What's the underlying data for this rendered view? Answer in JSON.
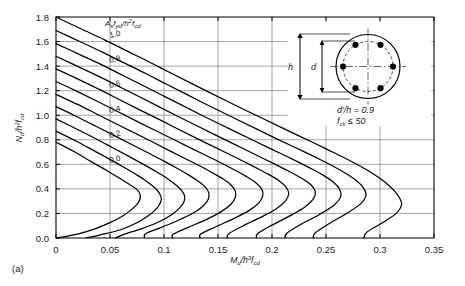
{
  "figure": {
    "panel_label": "(a)",
    "background": "#ffffff",
    "curve_color": "#000000",
    "grid_color": "#808080",
    "axis_color": "#000000"
  },
  "axes": {
    "x": {
      "label": "Md/h³fcd",
      "label_parts": {
        "main1": "M",
        "sub1": "d",
        "slash": "/h",
        "sup": "3",
        "main2": "f",
        "sub2": "cd"
      },
      "ticks": [
        "0",
        "0.05",
        "0.1",
        "0.15",
        "0.2",
        "0.25",
        "0.3",
        "0.35"
      ],
      "min": 0,
      "max": 0.35
    },
    "y": {
      "label": "Nd/h²fcd",
      "label_parts": {
        "main1": "N",
        "sub1": "d",
        "slash": "/h",
        "sup": "2",
        "main2": "f",
        "sub2": "cd"
      },
      "ticks": [
        "0.0",
        "0.2",
        "0.4",
        "0.6",
        "0.8",
        "1.0",
        "1.2",
        "1.4",
        "1.6",
        "1.8"
      ],
      "min": 0,
      "max": 1.8
    }
  },
  "series_label": {
    "text": "Asfyd/h²fcd",
    "parts": {
      "main1": "A",
      "sub1": "s",
      "main2": "f",
      "sub2": "yd",
      "slash": "/h",
      "sup": "2",
      "main3": "f",
      "sub3": "cd"
    }
  },
  "curve_labels": [
    "1.0",
    "0.8",
    "0.6",
    "0.4",
    "0.2",
    "0.0"
  ],
  "inset": {
    "dim_h": "h",
    "dim_d": "d",
    "note1": "d'/h = 0.9",
    "note2": "fck ≤ 50",
    "note2_parts": {
      "main": "f",
      "sub": "ck",
      "rest": " ≤ 50"
    },
    "bar_count": 6,
    "shape": "circular-section"
  },
  "chart_data": {
    "type": "line",
    "title": "",
    "xlabel": "Md/h³fcd",
    "ylabel": "Nd/h²fcd",
    "xlim": [
      0,
      0.35
    ],
    "ylim": [
      0,
      1.8
    ],
    "grid": true,
    "legend": "inline-curve-labels",
    "series_parameter": "Asfyd/h²fcd",
    "series": [
      {
        "name": "0.0",
        "omega": 0.0,
        "points": [
          [
            0.0,
            0.78
          ],
          [
            0.0175,
            0.7
          ],
          [
            0.033,
            0.62
          ],
          [
            0.047,
            0.55
          ],
          [
            0.06,
            0.48
          ],
          [
            0.069,
            0.43
          ],
          [
            0.0755,
            0.39
          ],
          [
            0.078,
            0.35
          ],
          [
            0.0775,
            0.31
          ],
          [
            0.0745,
            0.27
          ],
          [
            0.069,
            0.225
          ],
          [
            0.061,
            0.175
          ],
          [
            0.05,
            0.125
          ],
          [
            0.036,
            0.075
          ],
          [
            0.019,
            0.03
          ],
          [
            0.0,
            0.0
          ]
        ]
      },
      {
        "name": "0.1",
        "omega": 0.1,
        "points": [
          [
            0.0,
            0.87
          ],
          [
            0.0185,
            0.79
          ],
          [
            0.035,
            0.712
          ],
          [
            0.05,
            0.64
          ],
          [
            0.064,
            0.57
          ],
          [
            0.0755,
            0.51
          ],
          [
            0.085,
            0.455
          ],
          [
            0.092,
            0.405
          ],
          [
            0.096,
            0.36
          ],
          [
            0.0975,
            0.32
          ],
          [
            0.096,
            0.275
          ],
          [
            0.0915,
            0.225
          ],
          [
            0.0845,
            0.175
          ],
          [
            0.074,
            0.12
          ],
          [
            0.059,
            0.065
          ],
          [
            0.041,
            0.025
          ],
          [
            0.028,
            0.0
          ]
        ]
      },
      {
        "name": "0.2",
        "omega": 0.2,
        "points": [
          [
            0.0,
            0.97
          ],
          [
            0.019,
            0.888
          ],
          [
            0.0365,
            0.81
          ],
          [
            0.0525,
            0.735
          ],
          [
            0.0675,
            0.665
          ],
          [
            0.081,
            0.6
          ],
          [
            0.093,
            0.54
          ],
          [
            0.103,
            0.485
          ],
          [
            0.1105,
            0.435
          ],
          [
            0.116,
            0.39
          ],
          [
            0.119,
            0.345
          ],
          [
            0.1185,
            0.295
          ],
          [
            0.1145,
            0.245
          ],
          [
            0.107,
            0.19
          ],
          [
            0.095,
            0.13
          ],
          [
            0.079,
            0.075
          ],
          [
            0.063,
            0.03
          ],
          [
            0.055,
            0.0
          ]
        ]
      },
      {
        "name": "0.3",
        "omega": 0.3,
        "points": [
          [
            0.0,
            1.07
          ],
          [
            0.0195,
            0.988
          ],
          [
            0.0375,
            0.908
          ],
          [
            0.0545,
            0.832
          ],
          [
            0.0705,
            0.76
          ],
          [
            0.0855,
            0.692
          ],
          [
            0.0995,
            0.628
          ],
          [
            0.112,
            0.568
          ],
          [
            0.123,
            0.512
          ],
          [
            0.132,
            0.46
          ],
          [
            0.1385,
            0.412
          ],
          [
            0.1415,
            0.365
          ],
          [
            0.141,
            0.315
          ],
          [
            0.1365,
            0.262
          ],
          [
            0.1275,
            0.205
          ],
          [
            0.1135,
            0.145
          ],
          [
            0.097,
            0.085
          ],
          [
            0.083,
            0.035
          ],
          [
            0.082,
            0.0
          ]
        ]
      },
      {
        "name": "0.4",
        "omega": 0.4,
        "points": [
          [
            0.0,
            1.17
          ],
          [
            0.02,
            1.088
          ],
          [
            0.0385,
            1.006
          ],
          [
            0.056,
            0.928
          ],
          [
            0.073,
            0.854
          ],
          [
            0.089,
            0.784
          ],
          [
            0.104,
            0.716
          ],
          [
            0.1185,
            0.652
          ],
          [
            0.132,
            0.592
          ],
          [
            0.144,
            0.535
          ],
          [
            0.1545,
            0.482
          ],
          [
            0.162,
            0.432
          ],
          [
            0.166,
            0.382
          ],
          [
            0.166,
            0.33
          ],
          [
            0.162,
            0.275
          ],
          [
            0.153,
            0.215
          ],
          [
            0.139,
            0.15
          ],
          [
            0.122,
            0.085
          ],
          [
            0.1085,
            0.03
          ],
          [
            0.108,
            0.0
          ]
        ]
      },
      {
        "name": "0.5",
        "omega": 0.5,
        "points": [
          [
            0.0,
            1.275
          ],
          [
            0.0205,
            1.19
          ],
          [
            0.0395,
            1.108
          ],
          [
            0.0575,
            1.028
          ],
          [
            0.075,
            0.95
          ],
          [
            0.092,
            0.876
          ],
          [
            0.108,
            0.806
          ],
          [
            0.1235,
            0.738
          ],
          [
            0.1385,
            0.674
          ],
          [
            0.1525,
            0.613
          ],
          [
            0.165,
            0.556
          ],
          [
            0.176,
            0.502
          ],
          [
            0.185,
            0.45
          ],
          [
            0.1905,
            0.398
          ],
          [
            0.1915,
            0.345
          ],
          [
            0.188,
            0.288
          ],
          [
            0.179,
            0.225
          ],
          [
            0.165,
            0.16
          ],
          [
            0.148,
            0.092
          ],
          [
            0.134,
            0.032
          ],
          [
            0.1335,
            0.0
          ]
        ]
      },
      {
        "name": "0.6",
        "omega": 0.6,
        "points": [
          [
            0.0,
            1.378
          ],
          [
            0.021,
            1.292
          ],
          [
            0.0405,
            1.208
          ],
          [
            0.059,
            1.126
          ],
          [
            0.077,
            1.046
          ],
          [
            0.0945,
            0.97
          ],
          [
            0.111,
            0.896
          ],
          [
            0.127,
            0.826
          ],
          [
            0.1425,
            0.758
          ],
          [
            0.1575,
            0.694
          ],
          [
            0.1715,
            0.633
          ],
          [
            0.1845,
            0.575
          ],
          [
            0.1965,
            0.52
          ],
          [
            0.2065,
            0.467
          ],
          [
            0.213,
            0.415
          ],
          [
            0.2155,
            0.362
          ],
          [
            0.2125,
            0.303
          ],
          [
            0.204,
            0.238
          ],
          [
            0.19,
            0.17
          ],
          [
            0.173,
            0.098
          ],
          [
            0.16,
            0.035
          ],
          [
            0.1585,
            0.0
          ]
        ]
      },
      {
        "name": "0.7",
        "omega": 0.7,
        "points": [
          [
            0.0,
            1.48
          ],
          [
            0.0215,
            1.392
          ],
          [
            0.0415,
            1.308
          ],
          [
            0.0605,
            1.224
          ],
          [
            0.079,
            1.142
          ],
          [
            0.0965,
            1.064
          ],
          [
            0.1135,
            0.988
          ],
          [
            0.13,
            0.916
          ],
          [
            0.146,
            0.846
          ],
          [
            0.1615,
            0.779
          ],
          [
            0.1765,
            0.715
          ],
          [
            0.1905,
            0.654
          ],
          [
            0.204,
            0.596
          ],
          [
            0.2165,
            0.54
          ],
          [
            0.2275,
            0.487
          ],
          [
            0.236,
            0.434
          ],
          [
            0.24,
            0.38
          ],
          [
            0.2385,
            0.32
          ],
          [
            0.2305,
            0.252
          ],
          [
            0.2165,
            0.18
          ],
          [
            0.2,
            0.105
          ],
          [
            0.187,
            0.038
          ],
          [
            0.1855,
            0.0
          ]
        ]
      },
      {
        "name": "0.8",
        "omega": 0.8,
        "points": [
          [
            0.0,
            1.583
          ],
          [
            0.022,
            1.494
          ],
          [
            0.0425,
            1.41
          ],
          [
            0.062,
            1.324
          ],
          [
            0.081,
            1.24
          ],
          [
            0.099,
            1.16
          ],
          [
            0.1165,
            1.082
          ],
          [
            0.1335,
            1.006
          ],
          [
            0.15,
            0.935
          ],
          [
            0.166,
            0.866
          ],
          [
            0.1815,
            0.8
          ],
          [
            0.1965,
            0.736
          ],
          [
            0.211,
            0.676
          ],
          [
            0.2245,
            0.618
          ],
          [
            0.237,
            0.562
          ],
          [
            0.248,
            0.508
          ],
          [
            0.257,
            0.454
          ],
          [
            0.2625,
            0.398
          ],
          [
            0.2635,
            0.335
          ],
          [
            0.257,
            0.265
          ],
          [
            0.2435,
            0.19
          ],
          [
            0.227,
            0.112
          ],
          [
            0.214,
            0.04
          ],
          [
            0.212,
            0.0
          ]
        ]
      },
      {
        "name": "0.9",
        "omega": 0.9,
        "points": [
          [
            0.0,
            1.69
          ],
          [
            0.0225,
            1.598
          ],
          [
            0.0435,
            1.512
          ],
          [
            0.0635,
            1.424
          ],
          [
            0.083,
            1.34
          ],
          [
            0.1015,
            1.256
          ],
          [
            0.1195,
            1.176
          ],
          [
            0.137,
            1.098
          ],
          [
            0.154,
            1.024
          ],
          [
            0.1705,
            0.953
          ],
          [
            0.1865,
            0.885
          ],
          [
            0.202,
            0.818
          ],
          [
            0.217,
            0.755
          ],
          [
            0.2315,
            0.695
          ],
          [
            0.245,
            0.637
          ],
          [
            0.2575,
            0.58
          ],
          [
            0.2685,
            0.525
          ],
          [
            0.278,
            0.468
          ],
          [
            0.2845,
            0.41
          ],
          [
            0.287,
            0.348
          ],
          [
            0.282,
            0.278
          ],
          [
            0.269,
            0.2
          ],
          [
            0.253,
            0.118
          ],
          [
            0.24,
            0.042
          ],
          [
            0.238,
            0.0
          ]
        ]
      },
      {
        "name": "1.0",
        "omega": 1.0,
        "points": [
          [
            0.0,
            1.8
          ],
          [
            0.023,
            1.704
          ],
          [
            0.0445,
            1.616
          ],
          [
            0.065,
            1.526
          ],
          [
            0.085,
            1.44
          ],
          [
            0.104,
            1.354
          ],
          [
            0.1225,
            1.272
          ],
          [
            0.1405,
            1.192
          ],
          [
            0.158,
            1.116
          ],
          [
            0.175,
            1.043
          ],
          [
            0.1915,
            0.973
          ],
          [
            0.2075,
            0.905
          ],
          [
            0.223,
            0.84
          ],
          [
            0.238,
            0.778
          ],
          [
            0.252,
            0.718
          ],
          [
            0.2655,
            0.66
          ],
          [
            0.278,
            0.603
          ],
          [
            0.2895,
            0.546
          ],
          [
            0.2995,
            0.488
          ],
          [
            0.308,
            0.43
          ],
          [
            0.3145,
            0.372
          ],
          [
            0.3185,
            0.32
          ],
          [
            0.32,
            0.27
          ],
          [
            0.3155,
            0.205
          ],
          [
            0.303,
            0.128
          ],
          [
            0.288,
            0.048
          ],
          [
            0.285,
            0.0
          ]
        ]
      }
    ]
  }
}
